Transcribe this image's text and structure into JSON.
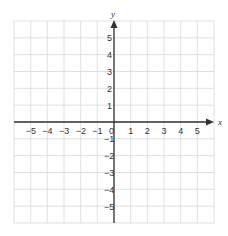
{
  "chart_data": {
    "type": "scatter",
    "title": "",
    "xlabel": "x",
    "ylabel": "y",
    "xlim": [
      -6,
      6
    ],
    "ylim": [
      -6,
      6
    ],
    "grid": true,
    "x_ticks": [
      -5,
      -4,
      -3,
      -2,
      -1,
      0,
      1,
      2,
      3,
      4,
      5
    ],
    "y_ticks": [
      -5,
      -4,
      -3,
      -2,
      -1,
      1,
      2,
      3,
      4,
      5
    ],
    "x_tick_labels": [
      "−5",
      "−4",
      "−3",
      "−2",
      "−1",
      "0",
      "1",
      "2",
      "3",
      "4",
      "5"
    ],
    "y_tick_labels": [
      "−5",
      "−4",
      "−3",
      "−2",
      "−1",
      "1",
      "2",
      "3",
      "4",
      "5"
    ],
    "series": [],
    "colors": {
      "axis": "#333333",
      "grid": "#d8d8d8",
      "text": "#333333"
    }
  }
}
